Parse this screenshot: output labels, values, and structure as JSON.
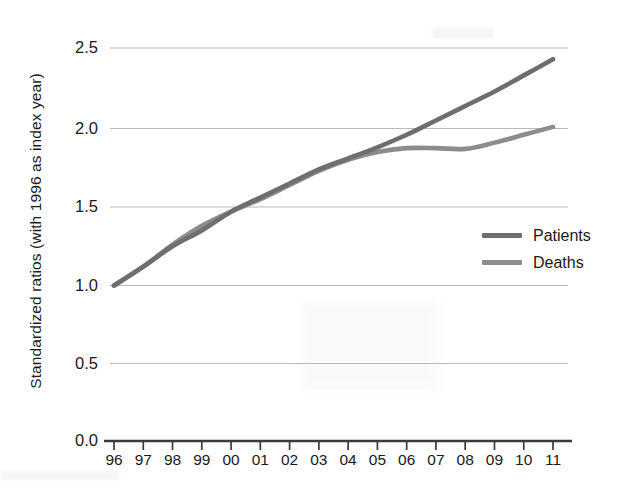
{
  "chart_data": {
    "type": "line",
    "title": "",
    "xlabel": "",
    "ylabel": "Standardized ratios (with 1996 as index year)",
    "x": [
      "96",
      "97",
      "98",
      "99",
      "00",
      "01",
      "02",
      "03",
      "04",
      "05",
      "06",
      "07",
      "08",
      "09",
      "10",
      "11"
    ],
    "x_full_years": [
      1996,
      1997,
      1998,
      1999,
      2000,
      2001,
      2002,
      2003,
      2004,
      2005,
      2006,
      2007,
      2008,
      2009,
      2010,
      2011
    ],
    "xlim": [
      1996,
      2011
    ],
    "ylim": [
      0.0,
      2.5
    ],
    "yticks": [
      "0.0",
      "0.5",
      "1.0",
      "1.5",
      "2.0",
      "2.5"
    ],
    "ytick_values": [
      0.0,
      0.5,
      1.0,
      1.5,
      2.0,
      2.5
    ],
    "grid": "horizontal",
    "legend_position": "center-right",
    "series": [
      {
        "name": "Patients",
        "color": "#6e6e6e",
        "values": [
          1.0,
          1.12,
          1.25,
          1.35,
          1.47,
          1.56,
          1.65,
          1.74,
          1.81,
          1.88,
          1.96,
          2.05,
          2.14,
          2.23,
          2.33,
          2.43
        ]
      },
      {
        "name": "Deaths",
        "color": "#8c8c8c",
        "values": [
          1.0,
          1.12,
          1.26,
          1.38,
          1.47,
          1.55,
          1.64,
          1.73,
          1.8,
          1.85,
          1.875,
          1.875,
          1.87,
          1.91,
          1.96,
          2.01
        ]
      }
    ]
  },
  "legend": {
    "items": [
      {
        "label": "Patients",
        "color": "#6e6e6e"
      },
      {
        "label": "Deaths",
        "color": "#8c8c8c"
      }
    ]
  },
  "axes": {
    "y_title": "Standardized ratios (with 1996 as index year)",
    "y_ticks": [
      "0.0",
      "0.5",
      "1.0",
      "1.5",
      "2.0",
      "2.5"
    ],
    "x_ticks": [
      "96",
      "97",
      "98",
      "99",
      "00",
      "01",
      "02",
      "03",
      "04",
      "05",
      "06",
      "07",
      "08",
      "09",
      "10",
      "11"
    ]
  },
  "colors": {
    "background": "#ffffff",
    "grid": "#b9b9b9",
    "axis": "#3a3a3a",
    "text": "#1a1a1a",
    "patients": "#6e6e6e",
    "deaths": "#8c8c8c"
  }
}
